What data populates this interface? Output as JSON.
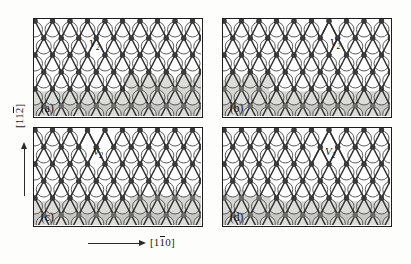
{
  "figure": {
    "type": "atomic-structure-diagram",
    "panel_count": 4
  },
  "axes": {
    "vertical": {
      "name": "vertical-crystal-direction",
      "indices": [
        "1",
        "1",
        "2"
      ],
      "overbar_index": 2,
      "text": "[112]",
      "arrow": "up-arrow"
    },
    "horizontal": {
      "name": "horizontal-crystal-direction",
      "indices": [
        "1",
        "1",
        "0"
      ],
      "overbar_index": 1,
      "text": "[110]",
      "arrow": "right-arrow"
    }
  },
  "panels": [
    {
      "id": "a",
      "letter": "(a)",
      "defect_label": {
        "symbol": "V",
        "subscript": "2"
      },
      "defect_pos": {
        "x": 0.355,
        "y": 0.275
      },
      "step_side": "right",
      "step_x": 0.565,
      "upper_terrace_y": 0.625,
      "lower_terrace_y": 0.745
    },
    {
      "id": "b",
      "letter": "(b)",
      "defect_label": {
        "symbol": "V",
        "subscript": "2"
      },
      "defect_pos": {
        "x": 0.665,
        "y": 0.265
      },
      "step_side": "left",
      "step_x": 0.275,
      "upper_terrace_y": 0.625,
      "lower_terrace_y": 0.745
    },
    {
      "id": "c",
      "letter": "(c)",
      "defect_label": {
        "symbol": "V",
        "subscript": "2"
      },
      "defect_pos": {
        "x": 0.375,
        "y": 0.265
      },
      "step_side": "right",
      "step_x": 0.575,
      "upper_terrace_y": 0.635,
      "lower_terrace_y": 0.755
    },
    {
      "id": "d",
      "letter": "(d)",
      "defect_label": {
        "symbol": "V",
        "subscript": "2"
      },
      "defect_pos": {
        "x": 0.635,
        "y": 0.265
      },
      "step_side": "left",
      "step_x": 0.285,
      "upper_terrace_y": 0.635,
      "lower_terrace_y": 0.755
    }
  ],
  "colors": {
    "frame": "#1c1c1c",
    "atom": "#3a3a3a",
    "bond": "#2f2f2f",
    "circle_fill": "#ffffff",
    "circle_stroke": "#4a4a4a",
    "terrace_shade_light": "#d6d6d2",
    "terrace_shade_dark": "#c2c2be",
    "shaded_circle_fill": "#dcdcd8",
    "background": "#fdfdfc"
  },
  "geometry": {
    "lattice": "hexagonal",
    "circle_diameter_px": 15,
    "row_spacing_px": 17,
    "col_spacing_px": 17.5,
    "rows": 6,
    "cols": 10
  }
}
